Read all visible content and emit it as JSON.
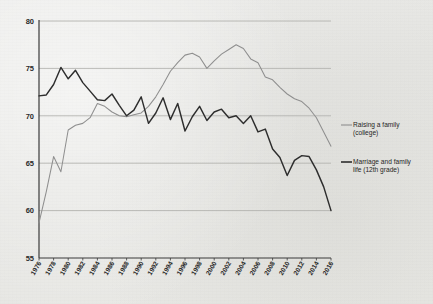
{
  "chart_data": {
    "type": "line",
    "title": "",
    "subtitle": "",
    "xlabel": "",
    "ylabel": "",
    "xlim": [
      1976,
      2016
    ],
    "ylim": [
      55,
      80
    ],
    "yticks": [
      55,
      60,
      65,
      70,
      75,
      80
    ],
    "ytick_labels": [
      "55",
      "60",
      "65",
      "70",
      "75",
      "80"
    ],
    "xticks": [
      1976,
      1978,
      1980,
      1982,
      1984,
      1986,
      1988,
      1990,
      1992,
      1994,
      1996,
      1998,
      2000,
      2002,
      2004,
      2006,
      2008,
      2010,
      2012,
      2014,
      2016
    ],
    "xtick_labels": [
      "1976",
      "1978",
      "1980",
      "1982",
      "1984",
      "1986",
      "1988",
      "1990",
      "1992",
      "1994",
      "1996",
      "1998",
      "2000",
      "2002",
      "2004",
      "2006",
      "2008",
      "2010",
      "2012",
      "2014",
      "2016"
    ],
    "grid": true,
    "grid_axis": "y",
    "legend_position": "right",
    "x": [
      1976,
      1977,
      1978,
      1979,
      1980,
      1981,
      1982,
      1983,
      1984,
      1985,
      1986,
      1987,
      1988,
      1989,
      1990,
      1991,
      1992,
      1993,
      1994,
      1995,
      1996,
      1997,
      1998,
      1999,
      2000,
      2001,
      2002,
      2003,
      2004,
      2005,
      2006,
      2007,
      2008,
      2009,
      2010,
      2011,
      2012,
      2013,
      2014,
      2015,
      2016
    ],
    "series": [
      {
        "name": "Raising a family (college)",
        "color": "#8f8f8f",
        "values": [
          58.7,
          62.0,
          65.7,
          64.1,
          68.5,
          69.0,
          69.2,
          69.8,
          71.3,
          71.0,
          70.4,
          70.0,
          69.9,
          70.1,
          70.3,
          71.0,
          72.0,
          73.3,
          74.7,
          75.6,
          76.4,
          76.6,
          76.2,
          75.0,
          75.8,
          76.5,
          77.0,
          77.5,
          77.1,
          76.0,
          75.6,
          74.1,
          73.8,
          73.0,
          72.3,
          71.8,
          71.5,
          70.8,
          69.8,
          68.3,
          66.8
        ]
      },
      {
        "name": "Marriage and family life (12th grade)",
        "color": "#2e2e2e",
        "values": [
          72.1,
          72.2,
          73.3,
          75.1,
          73.9,
          74.8,
          73.5,
          72.6,
          71.7,
          71.6,
          72.3,
          71.1,
          70.0,
          70.6,
          72.0,
          69.2,
          70.3,
          71.9,
          69.6,
          71.3,
          68.4,
          69.9,
          71.0,
          69.5,
          70.4,
          70.7,
          69.8,
          70.0,
          69.2,
          70.0,
          68.3,
          68.6,
          66.5,
          65.6,
          63.7,
          65.3,
          65.8,
          65.7,
          64.3,
          62.5,
          60.0
        ]
      }
    ]
  },
  "legend": {
    "items": [
      {
        "label_line1": "Raising a family",
        "label_line2": "(college)",
        "color": "#8f8f8f"
      },
      {
        "label_line1": "Marriage and family",
        "label_line2": "life (12th grade)",
        "color": "#2e2e2e"
      }
    ]
  },
  "axis_colors": {
    "grid": "#b4b4b0",
    "axis": "#3a3a3a",
    "text": "#2b2b2b"
  }
}
